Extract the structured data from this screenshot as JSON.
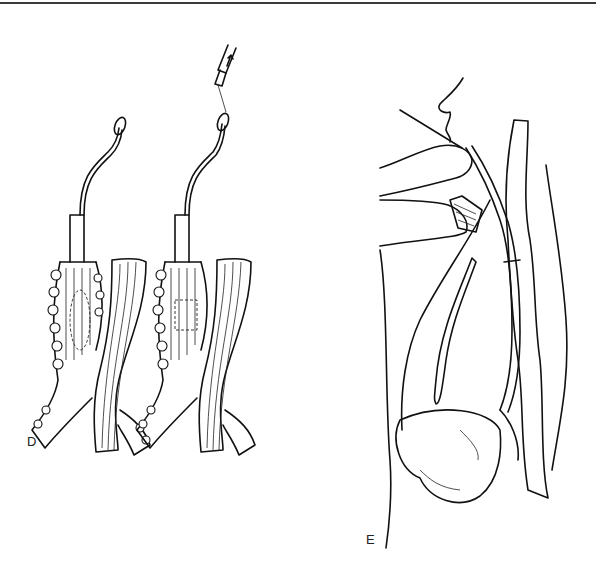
{
  "figure": {
    "top_rule": true,
    "panels": [
      {
        "id": "D",
        "label": "D",
        "description": "Two views of a tubular structure with catheter/tube inserted, crossing strap-like structures"
      },
      {
        "id": "E",
        "label": "E",
        "description": "Sagittal view: hands guiding a wire and tube through the mouth down the esophagus into the stomach"
      }
    ]
  },
  "colors": {
    "line": "#111111",
    "background": "#ffffff",
    "rule": "#3a3a3a"
  }
}
